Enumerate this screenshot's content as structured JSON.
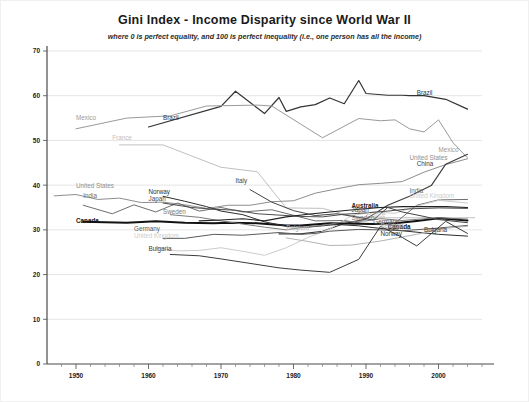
{
  "chart_data": {
    "type": "line",
    "title": "Gini Index - Income Disparity since World War II",
    "subtitle": "where 0 is perfect equality, and 100 is perfect inequality (i.e., one person has all the income)",
    "xlabel": "",
    "ylabel": "",
    "xlim": [
      1946,
      2006
    ],
    "ylim": [
      0,
      70
    ],
    "yticks": [
      0,
      10,
      20,
      30,
      40,
      50,
      60,
      70
    ],
    "xticks": [
      1950,
      1960,
      1970,
      1980,
      1990,
      2000
    ],
    "xminor_step": 2,
    "grid": "horizontal",
    "legend": "inline-labels",
    "series": [
      {
        "name": "Brazil",
        "color": "#333333",
        "width": 1.2,
        "label_left": {
          "text": "Brazil",
          "x": 1962,
          "y": 54.5
        },
        "label_right": {
          "text": "Brazil",
          "x": 1997,
          "y": 60.2
        },
        "x": [
          1960,
          1970,
          1972,
          1976,
          1978,
          1979,
          1981,
          1983,
          1985,
          1987,
          1989,
          1990,
          1993,
          1995,
          1996,
          1998,
          2001,
          2004
        ],
        "y": [
          53.0,
          57.6,
          61.0,
          56.0,
          59.6,
          56.5,
          57.5,
          58.0,
          59.5,
          58.2,
          63.4,
          60.5,
          60.1,
          60.1,
          60.0,
          60.0,
          59.2,
          57.0
        ]
      },
      {
        "name": "Mexico",
        "color": "#9a9a9a",
        "width": 1.0,
        "label_left": {
          "text": "Mexico",
          "x": 1950,
          "y": 54.5
        },
        "label_right": {
          "text": "Mexico",
          "x": 2000,
          "y": 47.5
        },
        "x": [
          1950,
          1957,
          1963,
          1968,
          1975,
          1977,
          1984,
          1989,
          1992,
          1994,
          1996,
          1998,
          2000,
          2002,
          2004
        ],
        "y": [
          52.6,
          55.0,
          55.5,
          57.7,
          57.9,
          57.7,
          50.6,
          54.9,
          54.4,
          54.6,
          52.6,
          51.9,
          54.6,
          49.5,
          46.1
        ]
      },
      {
        "name": "France",
        "color": "#c0c0c0",
        "width": 1.0,
        "label_left": {
          "text": "France",
          "x": 1955,
          "y": 50.0
        },
        "label_right": {
          "text": "France",
          "x": 1990,
          "y": 32.9
        },
        "x": [
          1956,
          1962,
          1970,
          1975,
          1979,
          1984,
          1989,
          1994,
          1995,
          2000,
          2005
        ],
        "y": [
          49.0,
          49.0,
          44.0,
          43.0,
          34.9,
          34.8,
          32.7,
          32.7,
          32.7,
          32.7,
          32.7
        ]
      },
      {
        "name": "United States",
        "color": "#8e8e8e",
        "width": 1.0,
        "label_left": {
          "text": "United States",
          "x": 1950,
          "y": 39.3
        },
        "label_right": {
          "text": "United States",
          "x": 1996,
          "y": 45.6
        },
        "x": [
          1947,
          1950,
          1953,
          1956,
          1959,
          1962,
          1965,
          1968,
          1971,
          1974,
          1977,
          1980,
          1983,
          1986,
          1989,
          1992,
          1995,
          1998,
          2001,
          2004
        ],
        "y": [
          37.6,
          37.9,
          36.8,
          37.1,
          36.1,
          36.2,
          35.6,
          34.8,
          35.5,
          35.5,
          36.3,
          36.5,
          38.2,
          39.2,
          40.1,
          40.4,
          40.8,
          42.9,
          44.6,
          45.9
        ]
      },
      {
        "name": "China",
        "color": "#3a3a3a",
        "width": 1.1,
        "label_right": {
          "text": "China",
          "x": 1997,
          "y": 44.2
        },
        "x": [
          1978,
          1981,
          1984,
          1987,
          1990,
          1993,
          1996,
          1999,
          2001,
          2004
        ],
        "y": [
          29.1,
          29.1,
          29.7,
          31.4,
          32.4,
          35.5,
          37.5,
          39.9,
          44.7,
          46.9
        ]
      },
      {
        "name": "India",
        "color": "#6e6e6e",
        "width": 1.0,
        "label_left": {
          "text": "India",
          "x": 1951,
          "y": 37.1
        },
        "label_right": {
          "text": "India",
          "x": 1996,
          "y": 38.3
        },
        "x": [
          1951,
          1955,
          1958,
          1961,
          1964,
          1967,
          1970,
          1973,
          1977,
          1983,
          1987,
          1990,
          1994,
          1997,
          2000,
          2004
        ],
        "y": [
          35.5,
          33.6,
          35.6,
          34.0,
          36.0,
          34.2,
          35.0,
          34.0,
          34.5,
          32.0,
          32.1,
          31.3,
          31.5,
          35.5,
          36.7,
          36.8
        ]
      },
      {
        "name": "United Kingdom",
        "color": "#cccccc",
        "width": 1.0,
        "label_left": {
          "text": "United Kingdom",
          "x": 1958,
          "y": 28.2
        },
        "label_right": {
          "text": "United Kingdom",
          "x": 1996,
          "y": 37.1
        },
        "x": [
          1961,
          1964,
          1967,
          1970,
          1973,
          1976,
          1979,
          1982,
          1985,
          1988,
          1991,
          1994,
          1997,
          2000,
          2004
        ],
        "y": [
          26.0,
          25.3,
          25.4,
          26.0,
          25.2,
          24.3,
          26.0,
          28.3,
          30.2,
          33.2,
          34.0,
          33.7,
          35.3,
          36.6,
          36.0
        ]
      },
      {
        "name": "Canada",
        "color": "#111111",
        "width": 2.0,
        "label_left": {
          "text": "Canada",
          "x": 1950,
          "y": 31.6
        },
        "label_right": {
          "text": "Canada",
          "x": 1993,
          "y": 30.2
        },
        "x": [
          1951,
          1957,
          1961,
          1965,
          1969,
          1971,
          1975,
          1979,
          1981,
          1985,
          1987,
          1991,
          1994,
          1997,
          2000,
          2004
        ],
        "y": [
          31.8,
          31.6,
          31.9,
          31.6,
          31.5,
          31.6,
          31.5,
          31.0,
          31.0,
          31.5,
          31.4,
          31.3,
          31.5,
          32.0,
          32.6,
          32.1
        ]
      },
      {
        "name": "Norway",
        "color": "#2e2e2e",
        "width": 1.0,
        "label_left": {
          "text": "Norway",
          "x": 1960,
          "y": 38.0
        },
        "label_right": {
          "text": "Norway",
          "x": 1992,
          "y": 28.6
        },
        "x": [
          1962,
          1965,
          1968,
          1970,
          1973,
          1976,
          1979,
          1982,
          1986,
          1989,
          1991,
          1995,
          2000,
          2004
        ],
        "y": [
          37.5,
          36.4,
          35.2,
          34.2,
          33.4,
          31.8,
          30.8,
          30.6,
          31.2,
          30.9,
          30.5,
          29.8,
          29.0,
          28.6
        ]
      },
      {
        "name": "Japan",
        "color": "#4d4d4d",
        "width": 1.0,
        "label_left": {
          "text": "Japan",
          "x": 1960,
          "y": 36.4
        },
        "label_right": {
          "text": "Japan",
          "x": 1988,
          "y": 34.0
        },
        "x": [
          1962,
          1966,
          1969,
          1972,
          1975,
          1978,
          1981,
          1984,
          1987,
          1990,
          1993,
          1996,
          2000,
          2004
        ],
        "y": [
          36.0,
          35.0,
          34.6,
          34.4,
          33.6,
          33.3,
          33.0,
          32.9,
          33.5,
          33.8,
          34.2,
          34.7,
          34.9,
          34.8
        ]
      },
      {
        "name": "Sweden",
        "color": "#7a7a7a",
        "width": 1.0,
        "label_left": {
          "text": "Sweden",
          "x": 1962,
          "y": 33.6
        },
        "label_right": {
          "text": "Sweden",
          "x": 1988,
          "y": 32.3
        },
        "x": [
          1963,
          1967,
          1970,
          1973,
          1976,
          1979,
          1981,
          1984,
          1987,
          1990,
          1992,
          1995,
          2000,
          2004
        ],
        "y": [
          33.4,
          32.8,
          32.0,
          31.3,
          30.6,
          30.0,
          30.5,
          31.0,
          31.8,
          32.0,
          32.5,
          32.1,
          32.7,
          32.4
        ]
      },
      {
        "name": "Australia",
        "color": "#222222",
        "width": 1.1,
        "label_right": {
          "text": "Australia",
          "x": 1988,
          "y": 34.8
        },
        "x": [
          1967,
          1970,
          1973,
          1976,
          1979,
          1982,
          1985,
          1989,
          1992,
          1995,
          1998,
          2001,
          2004
        ],
        "y": [
          32.0,
          32.2,
          32.5,
          32.0,
          32.9,
          33.5,
          34.0,
          34.6,
          35.0,
          35.2,
          35.2,
          35.2,
          35.0
        ]
      },
      {
        "name": "Germany",
        "color": "#5a5a5a",
        "width": 1.0,
        "label_left": {
          "text": "Germany",
          "x": 1958,
          "y": 29.7
        },
        "label_right": {
          "text": "Germany",
          "x": 1991,
          "y": 31.3
        },
        "x": [
          1962,
          1965,
          1969,
          1973,
          1978,
          1981,
          1983,
          1985,
          1989,
          1992,
          1995,
          2000,
          2004
        ],
        "y": [
          28.1,
          28.1,
          29.0,
          28.8,
          29.4,
          29.0,
          29.2,
          29.7,
          30.1,
          30.0,
          29.8,
          30.4,
          31.0
        ]
      },
      {
        "name": "Italy",
        "color": "#444444",
        "width": 1.0,
        "label_left": {
          "text": "Italy",
          "x": 1972,
          "y": 40.4
        },
        "label_right": {
          "text": "Italy",
          "x": 1993,
          "y": 30.1
        },
        "x": [
          1974,
          1977,
          1980,
          1983,
          1986,
          1989,
          1991,
          1993,
          1995,
          1998,
          2000,
          2004
        ],
        "y": [
          39.0,
          36.2,
          34.3,
          33.2,
          33.6,
          32.8,
          32.2,
          35.0,
          34.0,
          33.0,
          32.3,
          31.6
        ]
      },
      {
        "name": "Belgium",
        "color": "#b3b3b3",
        "width": 1.0,
        "label_left": {
          "text": "Belgium",
          "x": 1979,
          "y": 29.9
        },
        "label_right": {
          "text": "Belgium",
          "x": 1992,
          "y": 30.5
        },
        "x": [
          1979,
          1982,
          1985,
          1988,
          1992,
          1995,
          1997,
          2000,
          2004
        ],
        "y": [
          28.2,
          27.4,
          26.5,
          26.6,
          27.5,
          28.4,
          29.0,
          30.2,
          30.8
        ]
      },
      {
        "name": "Bulgaria",
        "color": "#3c3c3c",
        "width": 1.0,
        "label_left": {
          "text": "Bulgaria",
          "x": 1960,
          "y": 25.2
        },
        "label_right": {
          "text": "Bulgaria",
          "x": 1998,
          "y": 29.5
        },
        "x": [
          1963,
          1967,
          1970,
          1974,
          1978,
          1981,
          1985,
          1989,
          1992,
          1995,
          1997,
          2001,
          2004
        ],
        "y": [
          24.5,
          24.2,
          23.5,
          22.5,
          21.5,
          21.0,
          20.5,
          23.4,
          30.8,
          28.3,
          26.4,
          31.9,
          29.2
        ]
      }
    ]
  }
}
